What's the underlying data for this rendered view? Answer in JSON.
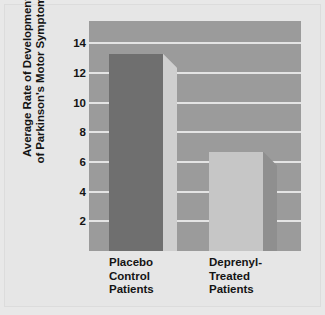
{
  "chart_data": {
    "type": "bar",
    "title": "",
    "subtitle": "",
    "xlabel": "",
    "ylabel": "Average Rate of Development of Parkinson's Motor Symptoms",
    "ylabel_lines": [
      "Average Rate of Development",
      "of Parkinson's Motor Symptoms"
    ],
    "categories": [
      "Placebo Control Patients",
      "Deprenyl-Treated Patients"
    ],
    "category_label_lines": [
      [
        "Placebo",
        "Control",
        "Patients"
      ],
      [
        "Deprenyl-",
        "Treated",
        "Patients"
      ]
    ],
    "values": [
      13.3,
      6.7
    ],
    "ylim": [
      0,
      15.5
    ],
    "yticks": [
      14,
      12,
      10,
      8,
      6,
      4,
      2
    ],
    "ytick_labels": [
      "14",
      "12",
      "10",
      "8",
      "6",
      "4",
      "2"
    ],
    "grid": true,
    "grid_axis": "y",
    "legend": "none",
    "legend_position": "none",
    "bar_style": "3d-beveled",
    "series": [
      {
        "name": "Average Rate of Development of Parkinson's Motor Symptoms",
        "values": [
          13.3,
          6.7
        ]
      }
    ],
    "bars": [
      {
        "category": "Placebo Control Patients",
        "value": 13.3,
        "front_color": "#6f6f6f",
        "side_color": "#cfcfcf"
      },
      {
        "category": "Deprenyl-Treated Patients",
        "value": 6.7,
        "front_color": "#c6c6c6",
        "side_color": "#8f8f8f"
      }
    ],
    "annotations": []
  },
  "colors": {
    "figure_background": "#e6e6e6",
    "plot_background": "#9b9b9b",
    "gridline": "#e4e4e4",
    "text": "#141414",
    "bar1_front": "#6f6f6f",
    "bar1_side": "#cfcfcf",
    "bar2_front": "#c6c6c6",
    "bar2_side": "#8f8f8f"
  }
}
